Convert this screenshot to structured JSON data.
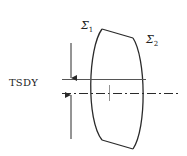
{
  "diagram": {
    "type": "lens-tilt-decenter-schematic",
    "labels": {
      "dimension": "TSDY",
      "surface1": {
        "symbol": "Σ",
        "subscript": "1"
      },
      "surface2": {
        "symbol": "Σ",
        "subscript": "2"
      }
    },
    "colors": {
      "stroke": "#2a2a2a",
      "background": "#ffffff",
      "text": "#222222"
    }
  }
}
